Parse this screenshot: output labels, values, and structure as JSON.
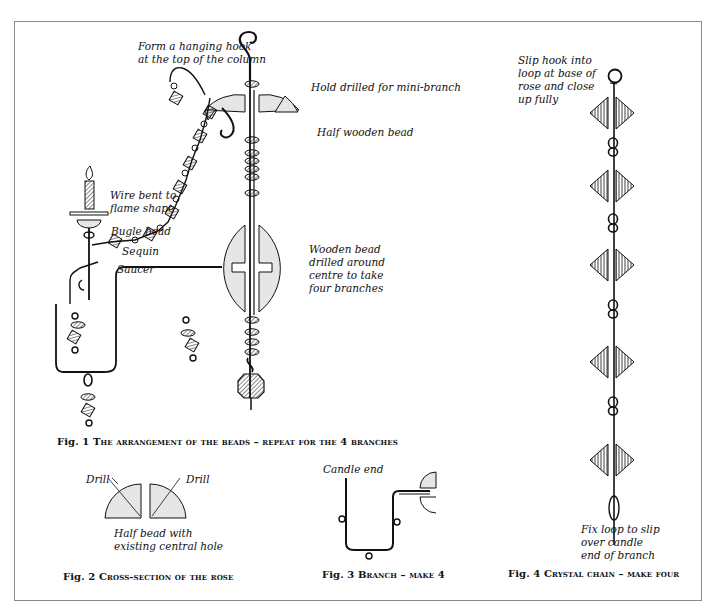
{
  "figures": {
    "fig1": {
      "labels": {
        "hook": "Form a hanging hook\nat the top of the column",
        "hole": "Hold drilled for mini-branch",
        "half_bead": "Half wooden bead",
        "wire": "Wire bent to\nflame shape",
        "bugle": "Bugle bead",
        "sequin": "Sequin",
        "saucer": "Saucer",
        "wooden_bead": "Wooden bead\ndrilled around\ncentre to take\nfour branches"
      },
      "caption_num": "Fig. 1",
      "caption_text": "The arrangement of the beads – repeat for the 4 branches"
    },
    "fig2": {
      "labels": {
        "drill_left": "Drill",
        "drill_right": "Drill",
        "half_bead": "Half bead with\nexisting central hole"
      },
      "caption_num": "Fig. 2",
      "caption_text": "Cross-section of the rose"
    },
    "fig3": {
      "labels": {
        "candle_end": "Candle end"
      },
      "caption_num": "Fig. 3",
      "caption_text": "Branch – make 4"
    },
    "fig4": {
      "labels": {
        "slip_hook": "Slip hook into\nloop at base of\nrose and close\nup fully",
        "fix_loop": "Fix loop to slip\nover candle\nend of branch"
      },
      "caption_num": "Fig. 4",
      "caption_text": "Crystal chain – make four"
    }
  },
  "colors": {
    "line": "#111111",
    "fill": "#e6e6e6",
    "frame": "#8a8a8a"
  }
}
